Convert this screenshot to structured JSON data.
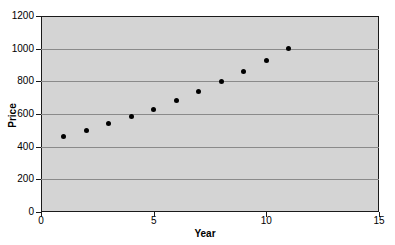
{
  "chart_data": {
    "type": "scatter",
    "title": "",
    "xlabel": "Year",
    "ylabel": "Price",
    "xlim": [
      0,
      15
    ],
    "ylim": [
      0,
      1200
    ],
    "xticks": [
      0,
      5,
      10,
      15
    ],
    "yticks": [
      0,
      200,
      400,
      600,
      800,
      1000,
      1200
    ],
    "grid": true,
    "legend": false,
    "x": [
      1,
      2,
      3,
      4,
      5,
      6,
      7,
      8,
      9,
      10,
      11
    ],
    "y": [
      465,
      500,
      540,
      585,
      630,
      680,
      740,
      800,
      860,
      930,
      1000
    ],
    "series": [
      {
        "name": "Price",
        "x": [
          1,
          2,
          3,
          4,
          5,
          6,
          7,
          8,
          9,
          10,
          11
        ],
        "values": [
          465,
          500,
          540,
          585,
          630,
          680,
          740,
          800,
          860,
          930,
          1000
        ]
      }
    ],
    "marker": "filled-circle",
    "marker_color": "#000000",
    "plot_background": "#d4d4d4",
    "gridline_color": "#8a8a8a",
    "axis_color": "#1a1a1a"
  },
  "axes": {
    "y_title": "Price",
    "x_title": "Year",
    "y_tick_labels": [
      "0",
      "200",
      "400",
      "600",
      "800",
      "1000",
      "1200"
    ],
    "x_tick_labels": [
      "0",
      "5",
      "10",
      "15"
    ]
  }
}
